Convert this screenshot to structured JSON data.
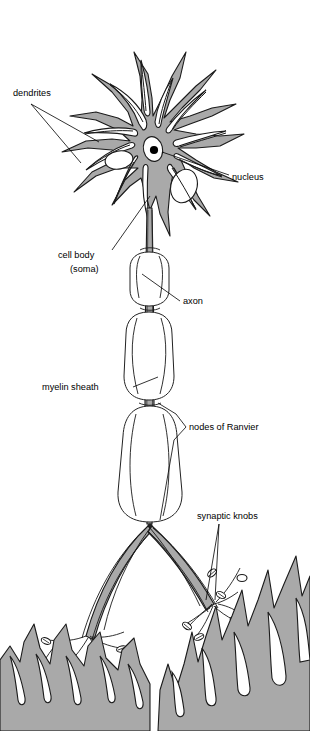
{
  "diagram": {
    "background_color": "#ffffff",
    "cytoplasm_color": "#a9a9a9",
    "outline_color": "#1a1a1a",
    "label_color": "#000000"
  },
  "labels": {
    "dendrites": "dendrites",
    "nucleus": "nucleus",
    "cell_body": "cell body",
    "soma": "(soma)",
    "axon": "axon",
    "myelin_sheath": "myelin sheath",
    "nodes_of_ranvier": "nodes of Ranvier",
    "synaptic_knobs": "synaptic knobs"
  },
  "parts": [
    {
      "id": "dendrites",
      "label": "dendrites",
      "label_x": 13,
      "label_y": 96
    },
    {
      "id": "nucleus",
      "label": "nucleus",
      "label_x": 232,
      "label_y": 180
    },
    {
      "id": "cell-body",
      "label": "cell body",
      "label_x": 58,
      "label_y": 258
    },
    {
      "id": "soma",
      "label": "(soma)",
      "label_x": 70,
      "label_y": 272
    },
    {
      "id": "axon",
      "label": "axon",
      "label_x": 183,
      "label_y": 304
    },
    {
      "id": "myelin-sheath",
      "label": "myelin sheath",
      "label_x": 42,
      "label_y": 390
    },
    {
      "id": "nodes-of-ranvier",
      "label": "nodes of Ranvier",
      "label_x": 189,
      "label_y": 430
    },
    {
      "id": "synaptic-knobs",
      "label": "synaptic knobs",
      "label_x": 197,
      "label_y": 519
    }
  ]
}
